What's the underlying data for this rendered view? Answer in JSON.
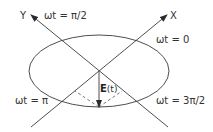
{
  "diagram": {
    "axes": {
      "x_label": "X",
      "y_label": "Y"
    },
    "phase_labels": {
      "top_left": "ωt = π/2",
      "top_right": "ωt = 0",
      "bottom_left": "ωt = π",
      "bottom_right": "ωt = 3π/2"
    },
    "vector": {
      "symbol": "E",
      "argument": "(t)"
    },
    "colors": {
      "stroke": "#3a3a3a",
      "text": "#333333"
    }
  }
}
